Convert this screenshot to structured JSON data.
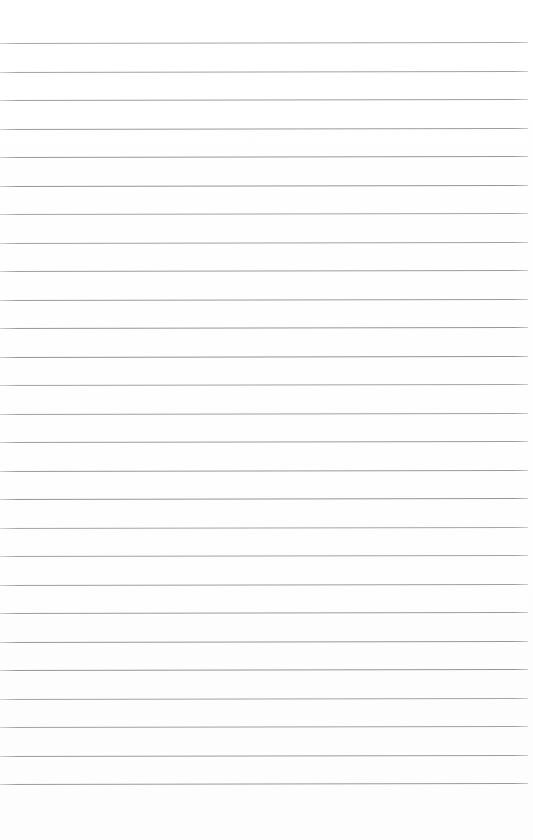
{
  "page": {
    "label": "Blank ruled notebook paper",
    "width": 533,
    "height": 840,
    "background_color": "#ffffff"
  },
  "ruled_lines": {
    "label": "Horizontal ruled lines",
    "count": 27,
    "color": "#8d9095",
    "thickness_px": 1,
    "spacing_px": 28.5,
    "first_line_y": 43,
    "last_line_y": 785,
    "line_start_x": 0,
    "line_end_x": 528,
    "skew_degrees": -0.12,
    "y_positions": [
      43,
      71.5,
      100,
      128.5,
      157,
      185.5,
      214,
      242.5,
      271,
      299.5,
      328,
      356.5,
      385,
      413.5,
      442,
      470.5,
      499,
      527.5,
      556,
      584.5,
      613,
      641.5,
      670,
      698.5,
      727,
      755.5,
      784
    ]
  },
  "margins": {
    "top_margin_px": 43,
    "bottom_margin_px": 55,
    "right_margin_px": 5,
    "left_margin_px": 0
  },
  "content": {
    "text": "",
    "has_writing": false,
    "has_vertical_margin_rule": false
  }
}
